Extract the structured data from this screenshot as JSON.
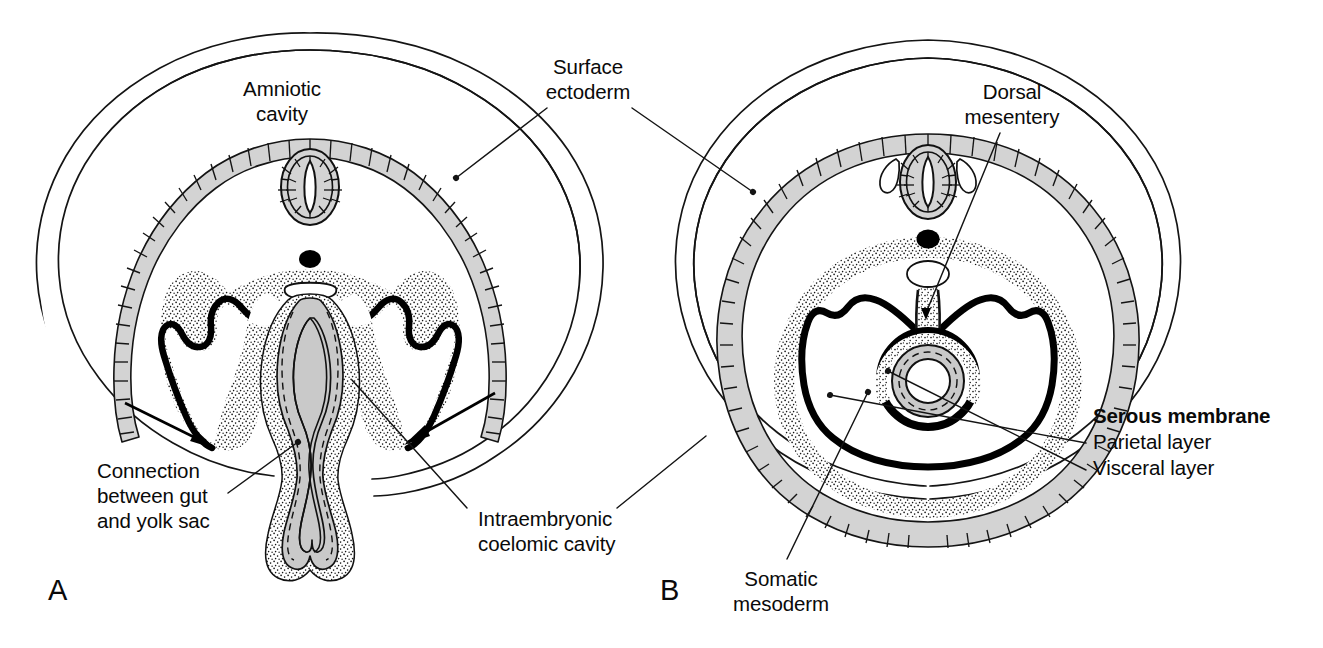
{
  "figure": {
    "background_color": "#ffffff",
    "ink_color": "#111111",
    "ectoderm_fill": "#d3d3d3",
    "endoderm_fill": "#c9c9c9",
    "stipple_color": "#1a1a1a"
  },
  "panels": [
    {
      "id": "A",
      "letter": "A",
      "letter_x": 48,
      "letter_y": 600,
      "description": "Earlier stage: embryo still broadly connected to the yolk sac; lateral body folds indicated by arrows"
    },
    {
      "id": "B",
      "letter": "B",
      "letter_x": 660,
      "letter_y": 600,
      "description": "Later stage: body wall closed, gut tube suspended by dorsal mesentery inside the coelomic cavity"
    }
  ],
  "labels": [
    {
      "name": "amniotic-cavity",
      "lines": [
        "Amniotic",
        "cavity"
      ],
      "x": 282,
      "y": 96,
      "anchor": "middle",
      "bold": false,
      "leaders": []
    },
    {
      "name": "surface-ectoderm",
      "lines": [
        "Surface",
        "ectoderm"
      ],
      "x": 588,
      "y": 74,
      "anchor": "middle",
      "bold": false,
      "leaders": [
        {
          "points": "547,108 456,178"
        },
        {
          "points": "632,108 753,192"
        }
      ]
    },
    {
      "name": "dorsal-mesentery",
      "lines": [
        "Dorsal",
        "mesentery"
      ],
      "x": 1012,
      "y": 99,
      "anchor": "middle",
      "bold": false,
      "leaders": [
        {
          "points": "1000,133 865,287"
        }
      ]
    },
    {
      "name": "connection-between-gut-and-yolk-sac",
      "lines": [
        "Connection",
        "between gut",
        "and yolk sac"
      ],
      "x": 97,
      "y": 478,
      "anchor": "start",
      "bold": false,
      "leaders": [
        {
          "points": "228,493 292,441"
        }
      ]
    },
    {
      "name": "intraembryonic-coelomic-cavity",
      "lines": [
        "Intraembryonic",
        "coelomic cavity"
      ],
      "x": 478,
      "y": 526,
      "anchor": "start",
      "bold": false,
      "leaders": [
        {
          "points": "467,508 352,380"
        },
        {
          "points": "617,508 702,440"
        }
      ]
    },
    {
      "name": "somatic-mesoderm",
      "lines": [
        "Somatic",
        "mesoderm"
      ],
      "x": 781,
      "y": 586,
      "anchor": "middle",
      "bold": false,
      "leaders": [
        {
          "points": "787,559 866,392"
        }
      ]
    },
    {
      "name": "serous-membrane-heading",
      "lines": [
        "Serous membrane"
      ],
      "x": 1093,
      "y": 423,
      "anchor": "start",
      "bold": true,
      "leaders": []
    },
    {
      "name": "parietal-layer",
      "lines": [
        "Parietal layer"
      ],
      "x": 1093,
      "y": 447,
      "anchor": "start",
      "bold": false,
      "leaders": [
        {
          "points": "1086,443 938,393"
        }
      ]
    },
    {
      "name": "visceral-layer",
      "lines": [
        "Visceral layer"
      ],
      "x": 1093,
      "y": 471,
      "anchor": "start",
      "bold": false,
      "leaders": [
        {
          "points": "1086,470 886,371"
        }
      ]
    }
  ],
  "structures": {
    "panel_a": [
      "chorion-outer-membrane",
      "amnion-membrane",
      "amniotic-cavity",
      "surface-ectoderm-band",
      "neural-tube",
      "notochord",
      "dorsal-aorta",
      "somatic-mesoderm-stipple",
      "splanchnic-mesoderm-thick-line",
      "intraembryonic-coelom-left",
      "intraembryonic-coelom-right",
      "gut-endoderm-gray",
      "yolk-sac-stalk",
      "body-fold-arrow-left",
      "body-fold-arrow-right"
    ],
    "panel_b": [
      "chorion-outer-membrane",
      "amnion-membrane",
      "amniotic-cavity",
      "surface-ectoderm-band",
      "neural-tube",
      "dorsal-root-ganglia",
      "notochord",
      "dorsal-aorta",
      "somatic-mesoderm-stipple",
      "parietal-serous-layer",
      "visceral-serous-layer",
      "dorsal-mesentery",
      "gut-tube",
      "intraembryonic-coelomic-cavity"
    ]
  }
}
